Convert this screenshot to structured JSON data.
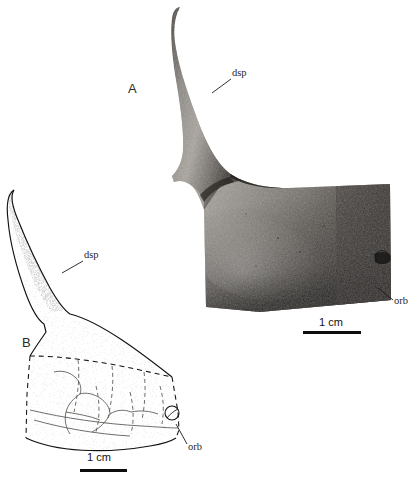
{
  "figure": {
    "background_color": "#ffffff",
    "width": 419,
    "height": 480,
    "ink_color": "#1a1a1a"
  },
  "panels": [
    {
      "id": "A",
      "letter": "A",
      "type": "photograph",
      "description": "photograph of fossil bone specimen",
      "labels": [
        {
          "name": "dsp",
          "text": "dsp"
        },
        {
          "name": "orb",
          "text": "orb"
        }
      ],
      "scale": {
        "text": "1 cm",
        "bar_length_px": 58
      }
    },
    {
      "id": "B",
      "letter": "B",
      "type": "line-drawing",
      "description": "interpretive line drawing of the same specimen with sutures and stippled shading",
      "labels": [
        {
          "name": "dsp",
          "text": "dsp"
        },
        {
          "name": "orb",
          "text": "orb"
        }
      ],
      "scale": {
        "text": "1 cm",
        "bar_length_px": 47
      }
    }
  ],
  "annotations": {
    "panel_a_letter": "A",
    "panel_b_letter": "B",
    "panel_a_dsp": "dsp",
    "panel_a_orb": "orb",
    "panel_a_scale": "1 cm",
    "panel_b_dsp": "dsp",
    "panel_b_orb": "orb",
    "panel_b_scale": "1 cm"
  }
}
